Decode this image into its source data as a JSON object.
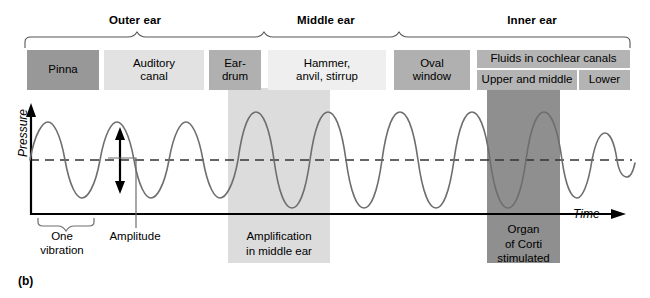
{
  "figure": {
    "panel_label": "(b)"
  },
  "sections": [
    {
      "label": "Outer ear",
      "center_x": 135,
      "start_x": 24,
      "end_x": 263
    },
    {
      "label": "Middle ear",
      "center_x": 326,
      "start_x": 263,
      "end_x": 472
    },
    {
      "label": "Inner ear",
      "center_x": 532,
      "start_x": 472,
      "end_x": 632
    }
  ],
  "structures": [
    {
      "name": "Pinna",
      "color": "#989898"
    },
    {
      "name": "Auditory\ncanal",
      "color": "#e2e2e2"
    },
    {
      "name": "Ear-\ndrum",
      "color": "#b0b0b0"
    },
    {
      "name": "Hammer,\nanvil, stirrup",
      "color": "#efefef"
    },
    {
      "name": "Oval\nwindow",
      "color": "#b0b0b0"
    },
    {
      "name": "Fluids in cochlear canals",
      "color": "#b4b4b4"
    },
    {
      "name": "Upper and middle",
      "color": "#b4b4b4"
    },
    {
      "name": "Lower",
      "color": "#b4b4b4"
    }
  ],
  "axes": {
    "y_label": "Pressure",
    "x_label": "Time"
  },
  "annotations": {
    "one_vibration": "One\nvibration",
    "amplitude": "Amplitude",
    "amplification": "Amplification\nin middle ear",
    "organ_of_corti": "Organ\nof Corti\nstimulated"
  },
  "bands": {
    "middle_ear": {
      "label": "Amplification in middle ear",
      "color": "#dcdcdc"
    },
    "inner_ear": {
      "label": "Organ of Corti stimulated",
      "color": "#8f8f8f"
    }
  },
  "chart_data": {
    "type": "line",
    "xlabel": "Time",
    "ylabel": "Pressure",
    "baseline_y": 160,
    "segments": [
      {
        "region": "outer ear",
        "cycles": 5,
        "relative_amplitude": 1.0
      },
      {
        "region": "middle ear",
        "cycles": 2,
        "relative_amplitude": 1.9
      },
      {
        "region": "inner ear",
        "cycles": 4,
        "relative_amplitude": 1.9
      },
      {
        "region": "damping",
        "cycles": 2,
        "relative_amplitude": 0.5
      }
    ]
  }
}
